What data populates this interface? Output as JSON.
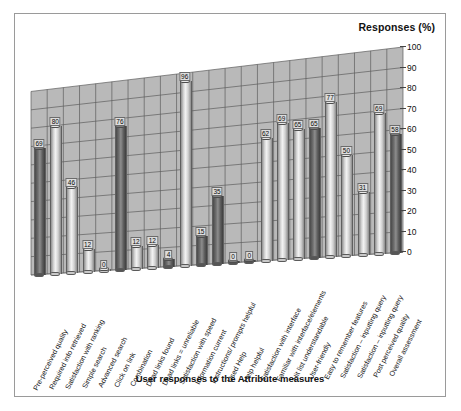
{
  "figure": {
    "yaxis_title": "Responses (%)",
    "xaxis_title": "User responses to the Attribute measures"
  },
  "colors": {
    "wall": "#b9b9b9",
    "grid": "#5d5d5d",
    "bar_light": "#e8e8e8",
    "bar_dark": "#5f5f5f",
    "frame": "#9a9a9a",
    "text": "#111111"
  },
  "chart_data": {
    "type": "bar",
    "title": "Responses (%)",
    "xlabel": "User responses to the Attribute measures",
    "ylabel": "Responses (%)",
    "ylim": [
      0,
      100
    ],
    "yticks": [
      100,
      90,
      80,
      70,
      60,
      50,
      40,
      30,
      20,
      10,
      0
    ],
    "grid": true,
    "legend": "none",
    "style": "3d-cylinder",
    "categories": [
      "Pre-perceived quality",
      "Required info retrieved",
      "Satisfaction with ranking",
      "Simple search",
      "Advanced search",
      "Click on link",
      "Combination",
      "Dead links found",
      "Dead links = unreliable",
      "Satisfaction with speed",
      "Information current",
      "Instructions/ prompts helpful",
      "Used Help",
      "Help helpful",
      "Satisfaction with interface",
      "Familiar with interface/elements",
      "Hit list understandable",
      "User-friendly",
      "Easy to remember features",
      "Satisfaction – inputting query",
      "Satisfaction – inputting query",
      "Post perceived quality",
      "Overall assessment"
    ],
    "values": [
      69,
      80,
      46,
      12,
      0,
      76,
      12,
      12,
      4,
      96,
      15,
      35,
      0,
      0,
      62,
      69,
      65,
      65,
      77,
      50,
      31,
      69,
      58
    ],
    "shades": [
      "dark",
      "light",
      "light",
      "light",
      "light",
      "dark",
      "light",
      "light",
      "dark",
      "light",
      "dark",
      "dark",
      "dark",
      "dark",
      "light",
      "light",
      "light",
      "dark",
      "light",
      "light",
      "light",
      "light",
      "dark"
    ]
  }
}
